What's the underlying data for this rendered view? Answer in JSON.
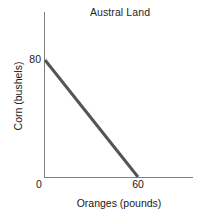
{
  "chart_data": {
    "type": "line",
    "title": "Austral Land",
    "xlabel": "Oranges (pounds)",
    "ylabel": "Corn (bushels)",
    "xlim": [
      0,
      78
    ],
    "ylim": [
      0,
      97
    ],
    "grid": false,
    "legend": null,
    "xticks": [
      {
        "value": 0,
        "label": "0"
      },
      {
        "value": 60,
        "label": "60"
      }
    ],
    "yticks": [
      {
        "value": 80,
        "label": "80"
      }
    ],
    "series": [
      {
        "name": "Production possibilities frontier",
        "color": "#555555",
        "linewidth": 3,
        "x": [
          0,
          60
        ],
        "y": [
          80,
          0
        ],
        "points": [
          {
            "x": 0,
            "y": 80
          },
          {
            "x": 60,
            "y": 0
          }
        ]
      }
    ],
    "axis_color": "#808080",
    "annotations": []
  }
}
